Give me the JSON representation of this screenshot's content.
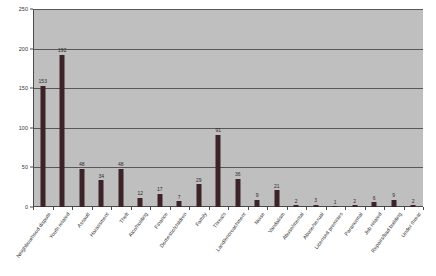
{
  "chart_data": {
    "type": "bar",
    "title": "",
    "xlabel": "",
    "ylabel": "",
    "ylim": [
      0,
      250
    ],
    "yticks": [
      0,
      50,
      100,
      150,
      200,
      250
    ],
    "grid": true,
    "legend": "none",
    "bar_color": "#3b2328",
    "plot_background": "#bfbfbf",
    "show_value_labels": true,
    "categories": [
      "Neighbourhood dispute",
      "Youth related",
      "Assault",
      "Harassment",
      "Theft",
      "Alco/holding",
      "Finance",
      "Domestic/children",
      "Family",
      "Threats",
      "Land/encroachment",
      "Noise",
      "Vandalism",
      "Abuse/mental",
      "Abuse/sexual",
      "Licensed premises",
      "Paranormal",
      "Job related",
      "Repairs/bad building",
      "Under threat"
    ],
    "values": [
      153,
      192,
      48,
      34,
      48,
      12,
      17,
      7,
      29,
      91,
      36,
      9,
      21,
      2,
      3,
      1,
      2,
      6,
      9,
      2
    ]
  }
}
